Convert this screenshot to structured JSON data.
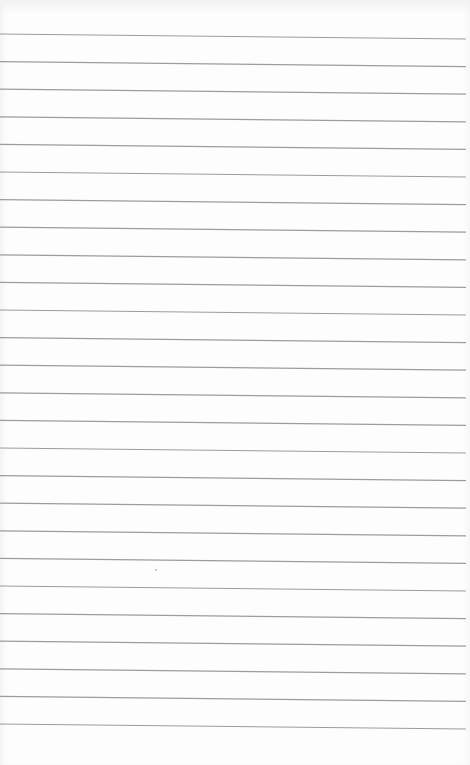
{
  "scene": {
    "subject": "blank ruled notepad page",
    "background_color": "#fdfdfd",
    "line_color": "#9c9c9c"
  },
  "rules": {
    "count": 26,
    "first_left_y": 34,
    "first_right_y": 39,
    "spacing": 27.6,
    "x_start": 0,
    "x_end": 466
  },
  "marks": [
    {
      "type": "dot",
      "x": 155,
      "y": 569
    }
  ]
}
